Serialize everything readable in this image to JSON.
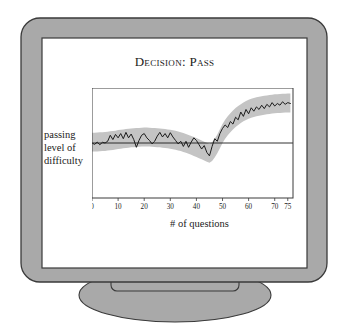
{
  "device": {
    "name": "crt-monitor",
    "bezel_color": "#a9a9a9",
    "bezel_outline_color": "#3a3a3a",
    "screen_color": "#ffffff",
    "screen_border_color": "#3a3a3a",
    "stand_color": "#a9a9a9"
  },
  "chart_data": {
    "type": "line",
    "title": "Decision: Pass",
    "xlabel": "# of questions",
    "ylabel_lines": [
      "passing",
      "level of",
      "difficulty"
    ],
    "grid": false,
    "legend": "none",
    "xlim": [
      0,
      77
    ],
    "ylim": [
      -3.2,
      3.2
    ],
    "xticks": [
      0,
      10,
      20,
      30,
      40,
      50,
      60,
      70,
      75
    ],
    "xticklabels": [
      "0",
      "10",
      "20",
      "30",
      "40",
      "50",
      "60",
      "70",
      "75"
    ],
    "yticks": [],
    "reference_line": {
      "name": "passing-level-line",
      "y": 0,
      "color": "#1b1b1b"
    },
    "band": {
      "name": "confidence-band",
      "color": "#c4c4c4",
      "half_width": 0.55
    },
    "series": [
      {
        "name": "estimated difficulty",
        "color": "#1b1b1b",
        "x": [
          0,
          1,
          2,
          3,
          4,
          5,
          6,
          7,
          8,
          9,
          10,
          11,
          12,
          13,
          14,
          15,
          16,
          17,
          18,
          19,
          20,
          21,
          22,
          23,
          24,
          25,
          26,
          27,
          28,
          29,
          30,
          31,
          32,
          33,
          34,
          35,
          36,
          37,
          38,
          39,
          40,
          41,
          42,
          43,
          44,
          45,
          46,
          47,
          48,
          49,
          50,
          51,
          52,
          53,
          54,
          55,
          56,
          57,
          58,
          59,
          60,
          61,
          62,
          63,
          64,
          65,
          66,
          67,
          68,
          69,
          70,
          71,
          72,
          73,
          74,
          75,
          76
        ],
        "y": [
          0.0,
          -0.08,
          0.05,
          -0.1,
          0.04,
          0.0,
          0.1,
          0.45,
          0.2,
          0.5,
          0.3,
          0.55,
          0.25,
          0.62,
          0.3,
          0.52,
          0.2,
          -0.25,
          0.15,
          0.45,
          0.55,
          0.3,
          0.15,
          -0.05,
          0.1,
          0.4,
          0.62,
          0.35,
          0.55,
          0.3,
          0.6,
          0.35,
          0.15,
          -0.05,
          0.1,
          -0.2,
          0.1,
          -0.25,
          0.05,
          0.3,
          0.15,
          -0.1,
          -0.35,
          -0.15,
          -0.55,
          -0.75,
          -0.2,
          0.25,
          0.1,
          0.55,
          0.85,
          1.05,
          0.9,
          1.25,
          1.1,
          1.5,
          1.35,
          1.8,
          1.55,
          1.95,
          1.7,
          2.05,
          1.85,
          2.1,
          1.95,
          2.2,
          2.0,
          2.25,
          2.1,
          2.35,
          2.15,
          2.3,
          2.2,
          2.4,
          2.25,
          2.35,
          2.3
        ],
        "band_center": [
          0.05,
          0.05,
          0.06,
          0.07,
          0.08,
          0.09,
          0.11,
          0.13,
          0.15,
          0.17,
          0.2,
          0.22,
          0.24,
          0.26,
          0.28,
          0.3,
          0.31,
          0.32,
          0.33,
          0.34,
          0.35,
          0.35,
          0.34,
          0.33,
          0.32,
          0.31,
          0.3,
          0.28,
          0.26,
          0.24,
          0.22,
          0.19,
          0.16,
          0.12,
          0.08,
          0.03,
          -0.02,
          -0.08,
          -0.14,
          -0.2,
          -0.26,
          -0.33,
          -0.4,
          -0.47,
          -0.54,
          -0.6,
          -0.5,
          -0.3,
          -0.05,
          0.25,
          0.55,
          0.8,
          1.0,
          1.18,
          1.34,
          1.48,
          1.6,
          1.71,
          1.81,
          1.89,
          1.96,
          2.02,
          2.07,
          2.11,
          2.14,
          2.17,
          2.2,
          2.22,
          2.24,
          2.26,
          2.28,
          2.29,
          2.3,
          2.31,
          2.32,
          2.33,
          2.33
        ]
      }
    ]
  }
}
